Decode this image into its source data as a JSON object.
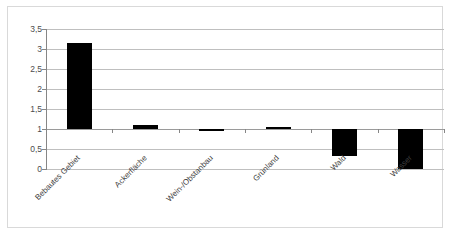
{
  "chart_data": {
    "type": "bar",
    "title": "",
    "subtitle": "",
    "xlabel": "",
    "ylabel": "",
    "categories": [
      "Bebautes Gebiet",
      "Ackerfläche",
      "Wein-/Obstanbau",
      "Grünland",
      "Wald",
      "Wasser"
    ],
    "values": [
      3.15,
      1.11,
      0.95,
      1.04,
      0.32,
      0.0
    ],
    "baseline": 1.0,
    "ylim": [
      0,
      3.5
    ],
    "ytick_labels": [
      "0",
      "0,5",
      "1",
      "1,5",
      "2",
      "2,5",
      "3",
      "3,5"
    ],
    "ytick_values": [
      0,
      0.5,
      1,
      1.5,
      2,
      2.5,
      3,
      3.5
    ],
    "grid": true,
    "legend": false,
    "legend_position": "none",
    "series": [
      {
        "name": "",
        "color": "#000000",
        "values": [
          3.15,
          1.11,
          0.95,
          1.04,
          0.32,
          0.0
        ]
      }
    ],
    "annotations": []
  },
  "colors": {
    "bar": "#000000",
    "gridline": "#bfbfbf",
    "axis": "#868686",
    "frame_border": "#d9d9d9",
    "tick_text": "#4c4c4c",
    "category_text": "#3f3f3f",
    "background": "#ffffff"
  }
}
